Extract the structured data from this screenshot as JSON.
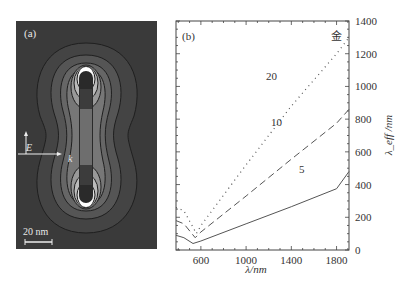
{
  "panel_a": {
    "label": "(a)",
    "field_e_label": "E",
    "wave_k_label": "k",
    "scale_bar_label": "20 nm"
  },
  "panel_b": {
    "label": "(b)",
    "material_label": "金"
  },
  "chart_data": {
    "type": "line",
    "title": "",
    "panel_label": "(b)",
    "annotation": "金",
    "xlabel": "λ/nm",
    "ylabel": "λ_eff /nm",
    "xlim": [
      380,
      1910
    ],
    "ylim": [
      0,
      1400
    ],
    "x_ticks": [
      600,
      1000,
      1400,
      1800
    ],
    "y_ticks": [
      0,
      200,
      400,
      600,
      800,
      1000,
      1200,
      1400
    ],
    "y_axis_position": "right",
    "grid": false,
    "legend": "inline curve labels",
    "series": [
      {
        "name": "5",
        "style": "solid",
        "x": [
          380,
          450,
          530,
          600,
          1000,
          1400,
          1800,
          1910
        ],
        "y": [
          90,
          75,
          40,
          55,
          160,
          265,
          375,
          480
        ]
      },
      {
        "name": "10",
        "style": "dashed",
        "x": [
          380,
          450,
          550,
          600,
          1000,
          1400,
          1800,
          1910
        ],
        "y": [
          180,
          160,
          75,
          110,
          330,
          555,
          775,
          860
        ]
      },
      {
        "name": "20",
        "style": "dotted",
        "x": [
          380,
          450,
          560,
          600,
          1000,
          1400,
          1800,
          1910
        ],
        "y": [
          260,
          240,
          100,
          150,
          520,
          880,
          1200,
          1300
        ]
      }
    ]
  }
}
